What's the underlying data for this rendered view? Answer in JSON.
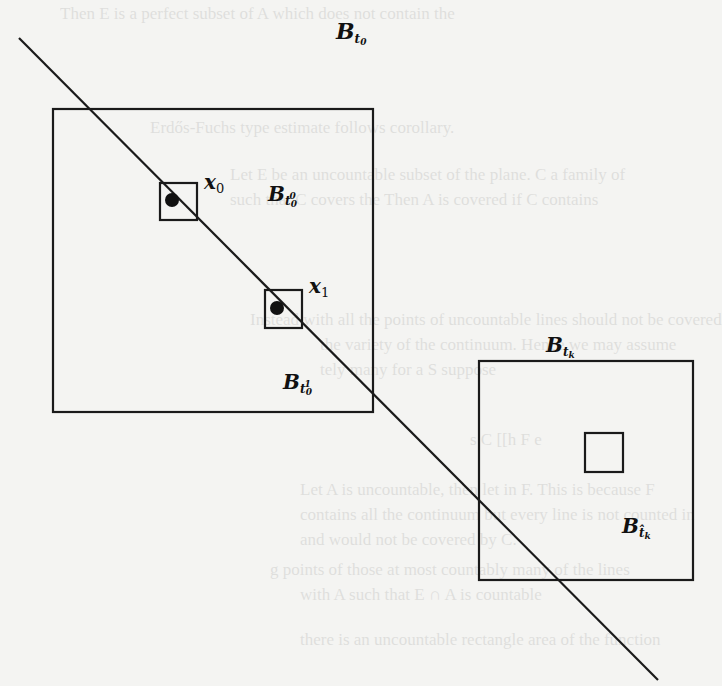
{
  "figure": {
    "type": "geometric-diagram",
    "line": {
      "x1": 19,
      "y1": 38,
      "x2": 658,
      "y2": 680
    },
    "boxes": [
      {
        "id": "B_t0_outer",
        "x": 53,
        "y": 109,
        "w": 320,
        "h": 303
      },
      {
        "id": "box_x0",
        "x": 160,
        "y": 183,
        "w": 37,
        "h": 37
      },
      {
        "id": "box_x1",
        "x": 265,
        "y": 290,
        "w": 37,
        "h": 38
      },
      {
        "id": "B_tk",
        "x": 479,
        "y": 361,
        "w": 214,
        "h": 219
      },
      {
        "id": "B_tk_hat_inner",
        "x": 585,
        "y": 433,
        "w": 38,
        "h": 39
      }
    ],
    "points": [
      {
        "id": "x0",
        "cx": 172,
        "cy": 200,
        "r": 7
      },
      {
        "id": "x1",
        "cx": 277,
        "cy": 308,
        "r": 7
      }
    ],
    "stroke_color": "#1a1a1a",
    "background_color": "#f4f4f2"
  },
  "labels": {
    "B_t0": {
      "base": "B",
      "sub": "t",
      "subsub": "0"
    },
    "x0": {
      "base": "x",
      "sub": "0"
    },
    "B_t00": {
      "base": "B",
      "sub": "t",
      "subsup": "0",
      "subsub": "0"
    },
    "x1": {
      "base": "x",
      "sub": "1"
    },
    "B_t01": {
      "base": "B",
      "sub": "t",
      "subsup": "1",
      "subsub": "0"
    },
    "B_tk": {
      "base": "B",
      "sub": "t",
      "subsub": "k"
    },
    "B_tk_hat": {
      "base": "B",
      "sub": "t̂",
      "subsub": "k"
    }
  },
  "bleed_through_text": [
    "Then E is a perfect subset of A which does not contain the",
    "Erdős-Fuchs type estimate follows corollary.",
    "Let E be an uncountable subset of the plane. C a family of",
    "such that C covers the Then A is covered if C contains",
    "Instead with all the points of uncountable lines should not be covered",
    "the variety of the continuum. Hence we may assume",
    "tely many for a S suppose",
    "s C [[h F e",
    "Let A is uncountable, then let in F. This is because F",
    "contains all the continuum but every line is not counted in",
    "and would not be covered by C.",
    "g points of those at most countably many of the lines",
    "with A such that E ∩ A is countable",
    "there is an uncountable rectangle area of the function"
  ]
}
